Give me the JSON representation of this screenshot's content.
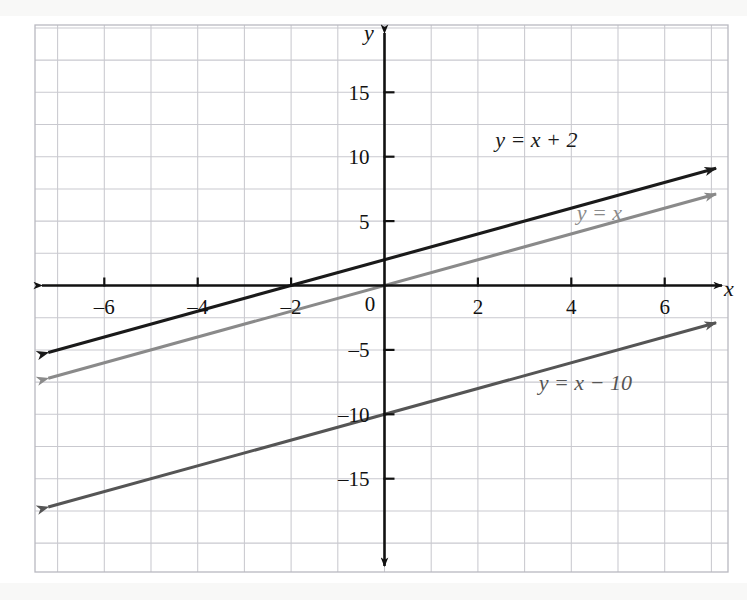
{
  "chart_data": {
    "type": "line",
    "title": "",
    "xlabel": "x",
    "ylabel": "y",
    "xlim": [
      -7.5,
      7.5
    ],
    "ylim": [
      -21.25,
      21.25
    ],
    "grid": true,
    "grid_step_x": 1,
    "grid_step_y": 2.5,
    "legend": "inline-annotations",
    "x_ticks": [
      {
        "value": -6,
        "label": "–6"
      },
      {
        "value": -4,
        "label": "–4"
      },
      {
        "value": -2,
        "label": "–2"
      },
      {
        "value": 2,
        "label": "2"
      },
      {
        "value": 4,
        "label": "4"
      },
      {
        "value": 6,
        "label": "6"
      }
    ],
    "y_ticks": [
      {
        "value": 15,
        "label": "15"
      },
      {
        "value": 10,
        "label": "10"
      },
      {
        "value": 5,
        "label": "5"
      },
      {
        "value": -5,
        "label": "–5"
      },
      {
        "value": -10,
        "label": "–10"
      },
      {
        "value": -15,
        "label": "–15"
      }
    ],
    "origin_label": "0",
    "series": [
      {
        "name": "y = x + 2",
        "label": "y = x + 2",
        "slope": 1,
        "intercept": 2,
        "color": "#1a1a1a",
        "x_range": [
          -7.2,
          7.1
        ],
        "y_range": [
          -5.2,
          9.1
        ],
        "label_x": 3.25,
        "label_y": 11.3,
        "arrows": "both"
      },
      {
        "name": "y = x",
        "label": "y = x",
        "slope": 1,
        "intercept": 0,
        "color": "#8a8a8a",
        "x_range": [
          -7.2,
          7.1
        ],
        "y_range": [
          -7.2,
          7.1
        ],
        "label_x": 4.6,
        "label_y": 5.6,
        "arrows": "both"
      },
      {
        "name": "y = x - 10",
        "label": "y = x − 10",
        "slope": 1,
        "intercept": -10,
        "color": "#555555",
        "x_range": [
          -7.2,
          7.1
        ],
        "y_range": [
          -17.2,
          -2.9
        ],
        "label_x": 4.3,
        "label_y": -7.6,
        "arrows": "both"
      }
    ]
  },
  "axes": {
    "x_axis_name": "x",
    "y_axis_name": "y",
    "x_axis_arrows": "both",
    "y_axis_arrows": "both",
    "axis_color": "#111111",
    "grid_color": "#c9c9cf",
    "grid_minor_color": "#e2e2e6"
  }
}
